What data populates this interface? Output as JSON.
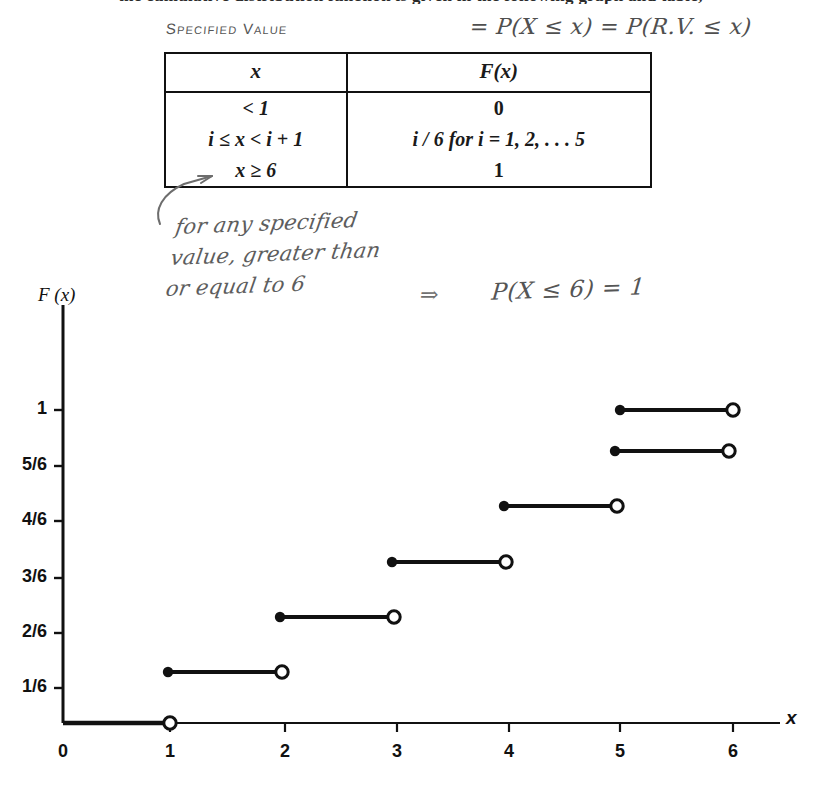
{
  "page": {
    "cutoff_top_text": "the cumulative distribution function is given in the following graph and table,"
  },
  "annotations": {
    "specified_value_label": "Specified Value",
    "probability_expr": "= P(X ≤ x) = P(R.V. ≤ x)",
    "note_line1": "for any specified",
    "note_line2": "value, greater than",
    "note_line3": "or equal to 6",
    "implies_symbol": "⇒",
    "result_expr": "P(X ≤ 6) = 1",
    "arrow_name": "curved-arrow-to-x-ge-6"
  },
  "table": {
    "headers": [
      "x",
      "F(x)"
    ],
    "rows": [
      {
        "x": "< 1",
        "f": "0"
      },
      {
        "x": "i ≤ x < i + 1",
        "f": "i / 6   for  i = 1, 2, . . . 5"
      },
      {
        "x": "x ≥ 6",
        "f": "1"
      }
    ]
  },
  "chart_data": {
    "type": "line",
    "title": "",
    "xlabel": "x",
    "ylabel": "F (x)",
    "xlim": [
      0,
      6.6
    ],
    "ylim": [
      0,
      1.12
    ],
    "grid": false,
    "legend": null,
    "x_ticks": [
      {
        "value": 0,
        "label": "0",
        "px": 63
      },
      {
        "value": 1,
        "label": "1",
        "px": 170
      },
      {
        "value": 2,
        "label": "2",
        "px": 285
      },
      {
        "value": 3,
        "label": "3",
        "px": 397
      },
      {
        "value": 4,
        "label": "4",
        "px": 509
      },
      {
        "value": 5,
        "label": "5",
        "px": 620
      },
      {
        "value": 6,
        "label": "6",
        "px": 733
      }
    ],
    "y_ticks": [
      {
        "value": 0.1667,
        "label": "1/6",
        "px": 688
      },
      {
        "value": 0.3333,
        "label": "2/6",
        "px": 633
      },
      {
        "value": 0.5,
        "label": "3/6",
        "px": 578
      },
      {
        "value": 0.6667,
        "label": "4/6",
        "px": 521
      },
      {
        "value": 0.8333,
        "label": "5/6",
        "px": 466
      },
      {
        "value": 1.0,
        "label": "1",
        "px": 410
      }
    ],
    "steps": [
      {
        "x_start": 0,
        "x_end": 1,
        "y": 0,
        "left_endpoint": "none",
        "right_endpoint": "open",
        "px": {
          "x1": 63,
          "x2": 170,
          "y": 723
        }
      },
      {
        "x_start": 1,
        "x_end": 2,
        "y": 0.1667,
        "left_endpoint": "closed",
        "right_endpoint": "open",
        "px": {
          "x1": 168,
          "x2": 282,
          "y": 672
        }
      },
      {
        "x_start": 2,
        "x_end": 3,
        "y": 0.3333,
        "left_endpoint": "closed",
        "right_endpoint": "open",
        "px": {
          "x1": 280,
          "x2": 394,
          "y": 617
        }
      },
      {
        "x_start": 3,
        "x_end": 4,
        "y": 0.5,
        "left_endpoint": "closed",
        "right_endpoint": "open",
        "px": {
          "x1": 392,
          "x2": 506,
          "y": 562
        }
      },
      {
        "x_start": 4,
        "x_end": 5,
        "y": 0.6667,
        "left_endpoint": "closed",
        "right_endpoint": "open",
        "px": {
          "x1": 504,
          "x2": 617,
          "y": 506
        }
      },
      {
        "x_start": 5,
        "x_end": 6,
        "y": 0.8333,
        "left_endpoint": "closed",
        "right_endpoint": "open",
        "px": {
          "x1": 615,
          "x2": 729,
          "y": 451
        }
      },
      {
        "x_start": 6,
        "x_end": 6.6,
        "y": 1.0,
        "left_endpoint": "closed",
        "right_endpoint": "open",
        "px": {
          "x1": 620,
          "x2": 733,
          "y": 410
        }
      }
    ],
    "axes_px": {
      "y_axis_x": 63,
      "x_axis_y": 723,
      "y_axis_top": 305,
      "x_axis_right": 780
    }
  }
}
